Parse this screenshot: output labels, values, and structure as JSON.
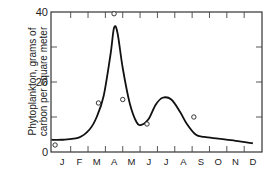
{
  "chart_data": {
    "type": "line",
    "title": "",
    "xlabel": "",
    "ylabel": "Phytoplankton, grams of carbon per square meter",
    "ylabel_lines": [
      "Phytoplankton, grams of",
      "carbon per square meter"
    ],
    "categories": [
      "J",
      "F",
      "M",
      "A",
      "M",
      "J",
      "J",
      "A",
      "S",
      "O",
      "N",
      "D"
    ],
    "ylim": [
      0,
      40
    ],
    "yticks": [
      0,
      10,
      20,
      30,
      40
    ],
    "ytick_labels": [
      "0",
      "20",
      "40"
    ],
    "grid": false,
    "series": [
      {
        "name": "smoothed curve",
        "style": "line",
        "x": [
          0.0,
          1.0,
          1.6,
          2.0,
          2.4,
          2.8,
          3.0,
          3.2,
          3.5,
          3.9,
          4.3,
          4.6,
          5.0,
          5.4,
          5.8,
          6.3,
          6.8,
          7.2,
          7.7,
          8.2,
          9.0,
          10.0,
          11.0
        ],
        "values": [
          3.5,
          4.2,
          6.5,
          10,
          16,
          28,
          35.5,
          34,
          24,
          14,
          8.5,
          7.8,
          9.5,
          13.5,
          15.5,
          15,
          11.5,
          8,
          5,
          4.3,
          3.8,
          3.2,
          2.5
        ]
      },
      {
        "name": "observations",
        "style": "scatter-open-circle",
        "x": [
          -0.4,
          2.1,
          3.0,
          3.5,
          4.9,
          7.6
        ],
        "values": [
          2,
          14,
          39.5,
          15,
          8,
          10
        ]
      }
    ],
    "legend": null
  }
}
